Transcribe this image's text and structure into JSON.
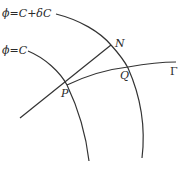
{
  "diagram": {
    "type": "level-surface geometry",
    "labels": {
      "outer_surface": "ϕ=C+δC",
      "inner_surface": "ϕ=C",
      "point_p": "P",
      "point_n": "N",
      "point_q": "Q",
      "curve_gamma": "Γ"
    },
    "colors": {
      "stroke": "#333333",
      "text": "#2a2a2a",
      "background": "#ffffff"
    }
  }
}
